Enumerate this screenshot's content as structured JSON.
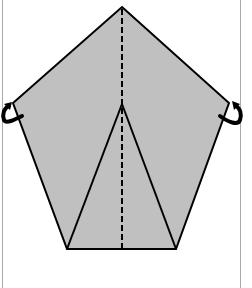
{
  "diagram": {
    "type": "origami-fold-diagram",
    "colors": {
      "paper": "#c0c0c0",
      "line": "#000000",
      "background": "#ffffff",
      "border": "#999999"
    },
    "pentagon": [
      [
        122,
        7
      ],
      [
        229,
        103
      ],
      [
        176,
        249
      ],
      [
        67,
        249
      ],
      [
        13,
        103
      ]
    ],
    "inner_triangle": [
      [
        122,
        104
      ],
      [
        67,
        249
      ],
      [
        176,
        249
      ]
    ],
    "valley_fold_line": {
      "x": 122,
      "y1": 7,
      "y2": 249
    },
    "arrows": [
      {
        "name": "left-fold-behind-arrow",
        "side": "left"
      },
      {
        "name": "right-fold-behind-arrow",
        "side": "right"
      }
    ]
  }
}
